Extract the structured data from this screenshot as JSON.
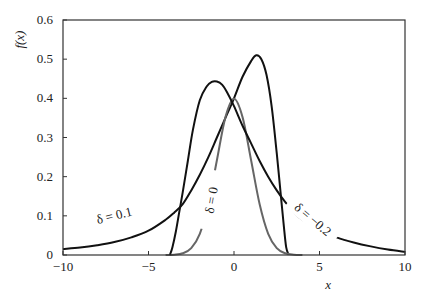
{
  "chart_data": {
    "type": "line",
    "title": "",
    "xlabel": "x",
    "ylabel": "f(x)",
    "xlim": [
      -10,
      10
    ],
    "ylim": [
      0,
      0.6
    ],
    "grid": false,
    "legend": "none (inline curve labels)",
    "x_ticks": [
      -10,
      -5,
      0,
      5,
      10
    ],
    "x_tick_labels": [
      "−10",
      "−5",
      "0",
      "5",
      "10"
    ],
    "y_ticks": [
      0,
      0.1,
      0.2,
      0.3,
      0.4,
      0.5,
      0.6
    ],
    "y_tick_labels": [
      "0",
      "0.1",
      "0.2",
      "0.3",
      "0.4",
      "0.5",
      "0.6"
    ],
    "series": [
      {
        "name": "δ = 0.1",
        "color": "#111111",
        "label_text": "δ = 0.1",
        "label_pos": {
          "x": -7.0,
          "y": 0.1,
          "angle": -14
        },
        "x": [
          -10,
          -9,
          -8,
          -7,
          -6,
          -5,
          -4,
          -3.5,
          -3,
          -2.5,
          -2,
          -1.5,
          -1,
          -0.5,
          0,
          0.5,
          1,
          1.3,
          1.6,
          1.9,
          2.2,
          2.5,
          2.7,
          2.9,
          3.05,
          3.2
        ],
        "y": [
          0.015,
          0.019,
          0.025,
          0.033,
          0.045,
          0.062,
          0.09,
          0.108,
          0.13,
          0.165,
          0.205,
          0.25,
          0.3,
          0.35,
          0.4,
          0.455,
          0.495,
          0.51,
          0.5,
          0.46,
          0.38,
          0.26,
          0.17,
          0.08,
          0.02,
          0.0
        ]
      },
      {
        "name": "δ = 0",
        "color": "#666666",
        "label_text": "δ = 0",
        "label_pos": {
          "x": -1.3,
          "y": 0.14,
          "angle": -80
        },
        "x": [
          -4,
          -3.5,
          -3,
          -2.5,
          -2,
          -1.5,
          -1,
          -0.5,
          0,
          0.5,
          1,
          1.5,
          2,
          2.5,
          3,
          3.5,
          4
        ],
        "y": [
          0.0001,
          0.0009,
          0.0044,
          0.0175,
          0.054,
          0.1295,
          0.242,
          0.352,
          0.399,
          0.352,
          0.242,
          0.1295,
          0.054,
          0.0175,
          0.0044,
          0.0009,
          0.0001
        ]
      },
      {
        "name": "δ = −0.2",
        "color": "#111111",
        "label_text": "δ = −0.2",
        "label_pos": {
          "x": 4.6,
          "y": 0.09,
          "angle": 40
        },
        "x": [
          -3.75,
          -3.6,
          -3.4,
          -3.2,
          -3,
          -2.7,
          -2.4,
          -2,
          -1.6,
          -1.3,
          -1,
          -0.7,
          -0.4,
          0,
          0.5,
          1,
          1.5,
          2,
          2.5,
          3,
          3.5,
          4,
          5,
          6,
          7,
          8,
          9,
          10
        ],
        "y": [
          0.0,
          0.02,
          0.06,
          0.11,
          0.16,
          0.24,
          0.32,
          0.395,
          0.43,
          0.442,
          0.443,
          0.435,
          0.415,
          0.38,
          0.33,
          0.285,
          0.24,
          0.2,
          0.165,
          0.135,
          0.11,
          0.09,
          0.063,
          0.045,
          0.032,
          0.022,
          0.014,
          0.008
        ]
      }
    ]
  },
  "axes": {
    "xlabel": "x",
    "ylabel": "f(x)"
  }
}
